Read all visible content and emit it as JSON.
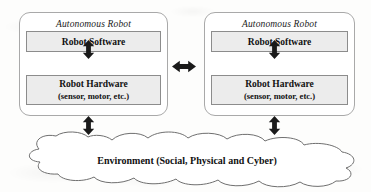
{
  "diagram": {
    "colors": {
      "panel_border": "#a9a9a9",
      "box_border": "#8c8c8c",
      "box_fill": "#ececec",
      "cloud_stroke": "#6f6f6f",
      "cloud_fill": "#ffffff",
      "arrow_fill": "#1a1a1a",
      "text": "#111111",
      "page_background": "#fdfdfc"
    },
    "robots": [
      {
        "id": "left",
        "title": "Autonomous Robot",
        "software_label": "Robot Software",
        "hardware_label": "Robot Hardware",
        "hardware_sublabel": "(sensor, motor, etc.)"
      },
      {
        "id": "right",
        "title": "Autonomous Robot",
        "software_label": "Robot Software",
        "hardware_label": "Robot Hardware",
        "hardware_sublabel": "(sensor, motor, etc.)"
      }
    ],
    "environment": {
      "label": "Environment (Social, Physical and Cyber)",
      "shape": "cloud"
    },
    "connectors": [
      {
        "id": "software-hardware-left",
        "icon": "double-arrow-vertical",
        "orientation": "vertical"
      },
      {
        "id": "software-hardware-right",
        "icon": "double-arrow-vertical",
        "orientation": "vertical"
      },
      {
        "id": "robot-environment-left",
        "icon": "double-arrow-vertical",
        "orientation": "vertical"
      },
      {
        "id": "robot-environment-right",
        "icon": "double-arrow-vertical",
        "orientation": "vertical"
      },
      {
        "id": "robot-to-robot",
        "icon": "double-arrow-horizontal",
        "orientation": "horizontal"
      }
    ]
  }
}
